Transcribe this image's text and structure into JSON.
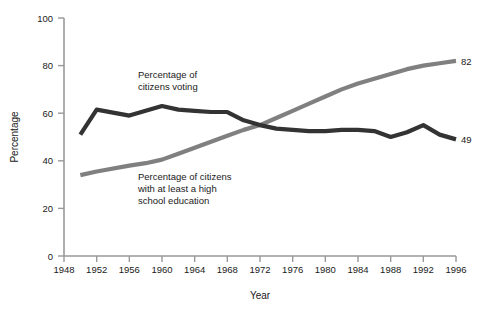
{
  "chart_data": {
    "type": "line",
    "title": "",
    "xlabel": "Year",
    "ylabel": "Percentage",
    "xlim": [
      1948,
      1996
    ],
    "ylim": [
      0,
      100
    ],
    "grid": false,
    "legend_position": "inline-annotations",
    "x_ticks": [
      "1948",
      "1952",
      "1956",
      "1960",
      "1964",
      "1968",
      "1972",
      "1976",
      "1980",
      "1984",
      "1988",
      "1992",
      "1996"
    ],
    "y_ticks": [
      "0",
      "20",
      "40",
      "60",
      "80",
      "100"
    ],
    "x": [
      1950,
      1952,
      1956,
      1958,
      1960,
      1962,
      1964,
      1966,
      1968,
      1970,
      1972,
      1974,
      1976,
      1978,
      1980,
      1982,
      1984,
      1986,
      1988,
      1990,
      1992,
      1994,
      1996
    ],
    "series": [
      {
        "name": "Percentage of citizens voting",
        "color": "#333333",
        "values": [
          51,
          61.5,
          59,
          61,
          63,
          61.5,
          61,
          60.5,
          60.5,
          57,
          55,
          53.5,
          53,
          52.5,
          52.5,
          53,
          53,
          52.5,
          50,
          52,
          55,
          51,
          49
        ],
        "end_label": "49",
        "annotation": "Percentage of\ncitizens voting"
      },
      {
        "name": "Percentage of citizens with at least a high school education",
        "color": "#808080",
        "values": [
          34,
          35.5,
          38,
          39,
          40.5,
          43,
          45.5,
          48,
          50.5,
          53,
          55,
          58,
          61,
          64,
          67,
          70,
          72.5,
          74.5,
          76.5,
          78.5,
          80,
          81,
          82
        ],
        "end_label": "82",
        "annotation": "Percentage of citizens\nwith at least a high\nschool education"
      }
    ],
    "annotations": {
      "voting_line1": "Percentage of",
      "voting_line2": "citizens voting",
      "education_line1": "Percentage of citizens",
      "education_line2": "with at least a high",
      "education_line3": "school education",
      "voting_end": "49",
      "education_end": "82"
    },
    "colors": {
      "voting": "#333333",
      "education": "#808080",
      "axis": "#999999",
      "text": "#1a1a1a",
      "background": "#ffffff"
    }
  }
}
